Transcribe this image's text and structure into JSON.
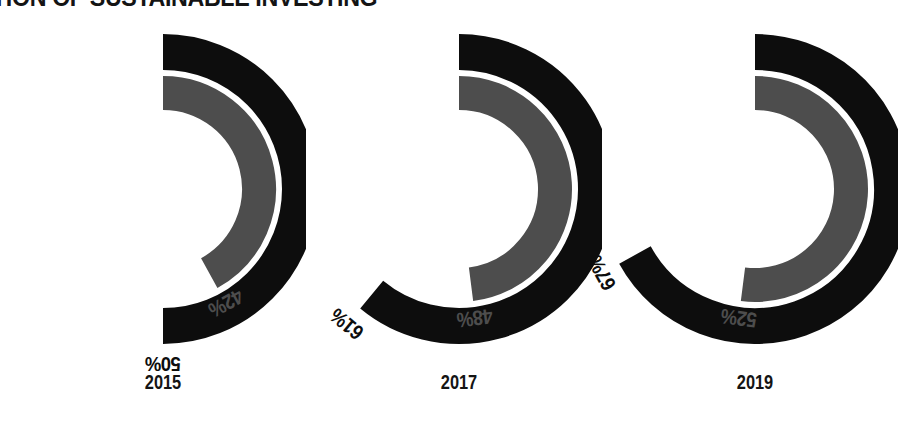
{
  "chart_data": {
    "type": "pie",
    "title": "TION OF SUSTAINABLE INVESTING",
    "subtitle": "",
    "xlabel": "",
    "ylabel": "",
    "grid": false,
    "legend_position": "none",
    "categories": [
      "2015",
      "2017",
      "2019"
    ],
    "series": [
      {
        "name": "outer-ring",
        "color": "#0d0d0d",
        "values": [
          50,
          61,
          67
        ],
        "labels": [
          "50%",
          "61%",
          "67%"
        ]
      },
      {
        "name": "inner-ring",
        "color": "#4d4d4d",
        "values": [
          42,
          48,
          52
        ],
        "labels": [
          "42%",
          "48%",
          "52%"
        ]
      }
    ],
    "units": "percent",
    "max": 100,
    "start_angle_deg": 0,
    "direction": "clockwise",
    "donuts": [
      {
        "year": "2015",
        "outer": {
          "value": 50,
          "label": "50%",
          "color": "#0d0d0d"
        },
        "inner": {
          "value": 42,
          "label": "42%",
          "color": "#4d4d4d"
        }
      },
      {
        "year": "2017",
        "outer": {
          "value": 61,
          "label": "61%",
          "color": "#0d0d0d"
        },
        "inner": {
          "value": 48,
          "label": "48%",
          "color": "#4d4d4d"
        }
      },
      {
        "year": "2019",
        "outer": {
          "value": 67,
          "label": "67%",
          "color": "#0d0d0d"
        },
        "inner": {
          "value": 52,
          "label": "52%",
          "color": "#4d4d4d"
        }
      }
    ]
  },
  "colors": {
    "background": "#ffffff",
    "outer_ring": "#0d0d0d",
    "inner_ring": "#4d4d4d",
    "ring_gap": "#ffffff",
    "title_text": "#141414",
    "year_text": "#141414"
  }
}
